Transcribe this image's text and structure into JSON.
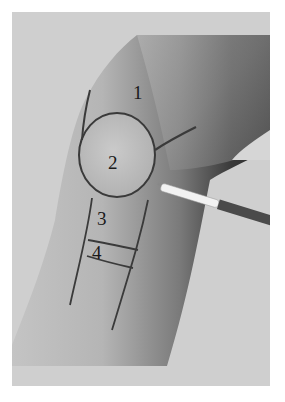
{
  "figure": {
    "labels": [
      {
        "id": "1",
        "text": "1",
        "x": 133,
        "y": 83
      },
      {
        "id": "2",
        "text": "2",
        "x": 108,
        "y": 153
      },
      {
        "id": "3",
        "text": "3",
        "x": 97,
        "y": 209
      },
      {
        "id": "4",
        "text": "4",
        "x": 92,
        "y": 243
      }
    ],
    "colors": {
      "background": "#cfcfcf",
      "skin_light": "#bdbdbd",
      "skin_dark": "#2e2e2e",
      "marker": "#3a3a3a",
      "syringe": "#f2f2f2"
    }
  }
}
